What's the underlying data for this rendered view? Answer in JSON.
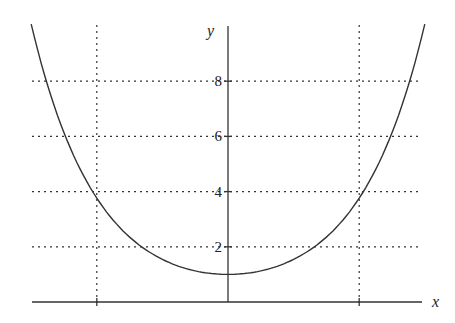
{
  "chart_data": {
    "type": "line",
    "title": "",
    "function": "y = cosh(x)",
    "xlabel": "x",
    "ylabel": "y",
    "xlim": [
      -3.0,
      3.0
    ],
    "ylim": [
      0,
      10
    ],
    "x_ticks": [
      -2,
      2
    ],
    "y_ticks": [
      2,
      4,
      6,
      8
    ],
    "y_tick_labels": [
      "2",
      "4",
      "6",
      "8"
    ],
    "grid": {
      "horizontal": [
        2,
        4,
        6,
        8
      ],
      "vertical": [
        -2,
        2
      ],
      "style": "dotted"
    },
    "legend": null,
    "series": [
      {
        "name": "cosh(x)",
        "x": [
          -3.0,
          -2.5,
          -2.0,
          -1.5,
          -1.0,
          -0.5,
          0,
          0.5,
          1.0,
          1.5,
          2.0,
          2.5,
          3.0
        ],
        "y": [
          10.07,
          6.13,
          3.76,
          2.35,
          1.54,
          1.13,
          1.0,
          1.13,
          1.54,
          2.35,
          3.76,
          6.13,
          10.07
        ]
      }
    ]
  }
}
